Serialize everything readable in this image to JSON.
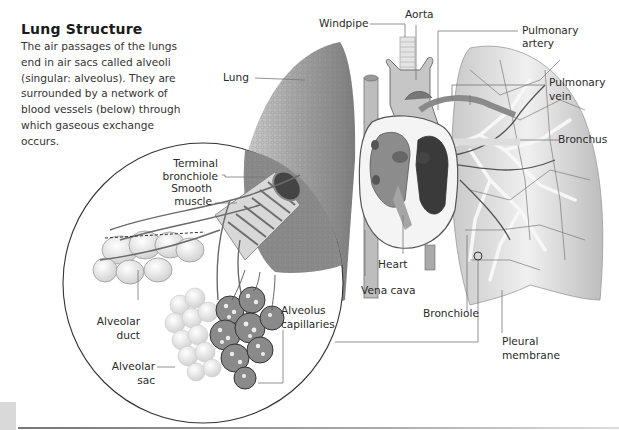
{
  "header": {
    "title": "Lung Structure",
    "intro": "The air passages of the lungs end in air sacs called alveoli (singular: alveolus). They are surrounded by a network of blood vessels (below) through which gaseous exchange occurs."
  },
  "labels": {
    "windpipe": "Windpipe",
    "aorta": "Aorta",
    "pulmonary_artery_1": "Pulmonary",
    "pulmonary_artery_2": "artery",
    "pulmonary_vein_1": "Pulmonary",
    "pulmonary_vein_2": "vein",
    "bronchus": "Bronchus",
    "lung": "Lung",
    "terminal_bronchiole_1": "Terminal",
    "terminal_bronchiole_2": "bronchiole",
    "smooth_muscle_1": "Smooth",
    "smooth_muscle_2": "muscle",
    "heart": "Heart",
    "vena_cava": "Vena cava",
    "bronchiole": "Bronchiole",
    "pleural_membrane_1": "Pleural",
    "pleural_membrane_2": "membrane",
    "alveolar_duct_1": "Alveolar",
    "alveolar_duct_2": "duct",
    "alveolus_capillaries_1": "Alveolus",
    "alveolus_capillaries_2": "capillaries",
    "alveolar_sac_1": "Alveolar",
    "alveolar_sac_2": "sac"
  },
  "colors": {
    "lung_tissue": "#9a9a9a",
    "lung_light": "#e6e6e6",
    "heart_dark": "#555555",
    "leader_line": "#777777",
    "text": "#2a2a2a"
  }
}
